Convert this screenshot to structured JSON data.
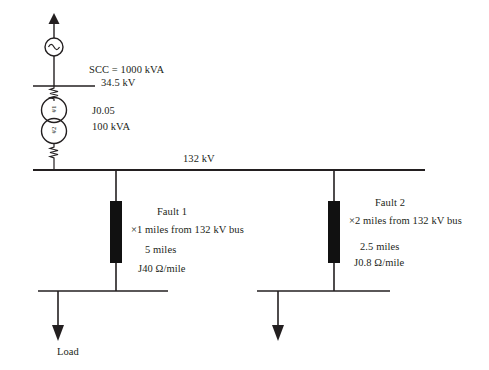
{
  "figure": {
    "type": "single-line-diagram"
  },
  "source": {
    "symbol": "ac-source",
    "scc_label": "SCC = 1000 kVA",
    "voltage_label": "34.5 kV"
  },
  "transformer": {
    "winding_primary_label": "#1",
    "winding_secondary_label": "#2",
    "impedance_label": "J0.05",
    "rating_label": "100 kVA"
  },
  "bus": {
    "hv_label": "132 kV"
  },
  "faults": [
    {
      "name": "Fault 1",
      "distance_label": "×1 miles from 132 kV bus",
      "length_label": "5 miles",
      "impedance_label": "J40 Ω/mile"
    },
    {
      "name": "Fault 2",
      "distance_label": "×2 miles from 132 kV bus",
      "length_label": "2.5 miles",
      "impedance_label": "J0.8 Ω/mile"
    }
  ],
  "loads": [
    {
      "label": "Load"
    },
    {
      "label": ""
    }
  ],
  "colors": {
    "line": "#231f20",
    "text": "#231f20",
    "background": "#ffffff",
    "block_fill": "#111111"
  }
}
